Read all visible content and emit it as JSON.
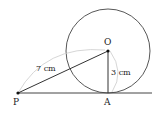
{
  "diagram": {
    "points": {
      "O": "O",
      "P": "P",
      "A": "A"
    },
    "labels": {
      "PO": "7 cm",
      "OA": "3 cm"
    },
    "colors": {
      "stroke": "#333333",
      "arc": "#cccccc",
      "text": "#222222"
    }
  }
}
